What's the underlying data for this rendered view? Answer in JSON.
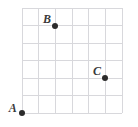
{
  "figure": {
    "title": "",
    "background_color": "#ffffff"
  },
  "chart_data": {
    "type": "scatter",
    "title": "",
    "xlabel": "",
    "ylabel": "",
    "grid": true,
    "grid_color": "#d8d8dc",
    "grid_columns": 6,
    "grid_rows": 6,
    "xlim": [
      0,
      6
    ],
    "ylim": [
      0,
      6
    ],
    "legend": "none",
    "point_color": "#2b2b2b",
    "points": [
      {
        "label": "A",
        "x": 0,
        "y": 0,
        "label_dx": -0.55,
        "label_dy": 0.3
      },
      {
        "label": "B",
        "x": 2,
        "y": 5,
        "label_dx": -0.5,
        "label_dy": 0.38
      },
      {
        "label": "C",
        "x": 5,
        "y": 2,
        "label_dx": -0.5,
        "label_dy": 0.38
      }
    ]
  },
  "geometry": {
    "grid_left": 22,
    "grid_top": 8,
    "grid_right": 122,
    "grid_bottom": 113,
    "dot_diameter": 6
  }
}
